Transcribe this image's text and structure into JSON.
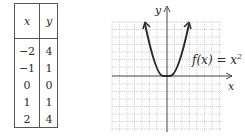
{
  "table": {
    "headers": [
      "x",
      "y"
    ],
    "rows": [
      {
        "x": "−2",
        "y": "4"
      },
      {
        "x": "−1",
        "y": "1"
      },
      {
        "x": "0",
        "y": "0"
      },
      {
        "x": "1",
        "y": "1"
      },
      {
        "x": "2",
        "y": "4"
      }
    ]
  },
  "graph": {
    "x_axis_label": "x",
    "y_axis_label": "y",
    "function_label_prefix": "f(x) = x",
    "function_label_exponent": "2",
    "curve_color": "#2a2a2a",
    "grid_color": "#b8b8b8"
  }
}
